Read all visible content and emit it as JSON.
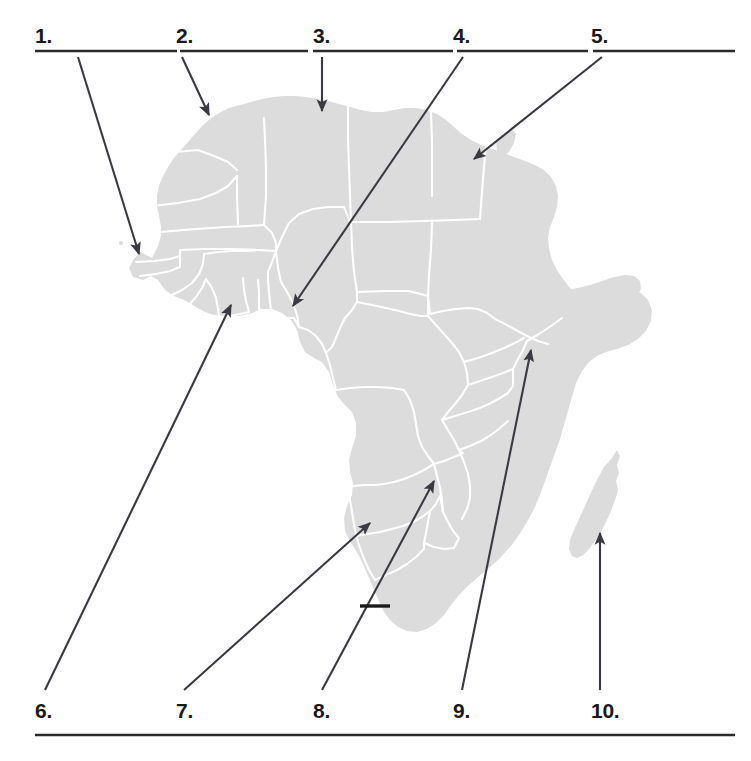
{
  "worksheet": {
    "title": "Africa map labeling worksheet",
    "map_name": "africa-map",
    "map_fill": "#dcdcdc",
    "map_border": "#ffffff",
    "arrow_color": "#3a3a42",
    "rule_color": "#2b2b2b",
    "background": "#ffffff"
  },
  "top_blanks": [
    {
      "number": "1.",
      "label_x": 35,
      "label_y": 25,
      "line_x": 35,
      "line_y": 51,
      "line_w": 142
    },
    {
      "number": "2.",
      "label_x": 176,
      "label_y": 25,
      "line_x": 180,
      "line_y": 51,
      "line_w": 128
    },
    {
      "number": "3.",
      "label_x": 313,
      "label_y": 25,
      "line_x": 313,
      "line_y": 51,
      "line_w": 140
    },
    {
      "number": "4.",
      "label_x": 453,
      "label_y": 25,
      "line_x": 457,
      "line_y": 51,
      "line_w": 131
    },
    {
      "number": "5.",
      "label_x": 591,
      "label_y": 25,
      "line_x": 593,
      "line_y": 51,
      "line_w": 142
    }
  ],
  "bottom_blanks": [
    {
      "number": "6.",
      "label_x": 35,
      "label_y": 700
    },
    {
      "number": "7.",
      "label_x": 176,
      "label_y": 700
    },
    {
      "number": "8.",
      "label_x": 313,
      "label_y": 700
    },
    {
      "number": "9.",
      "label_x": 453,
      "label_y": 700
    },
    {
      "number": "10.",
      "label_x": 591,
      "label_y": 700
    }
  ],
  "bottom_rule": {
    "x": 35,
    "y": 735,
    "w": 700
  },
  "pointers": [
    {
      "id": "pointer-1",
      "from": [
        78,
        57
      ],
      "to": [
        139,
        254
      ],
      "target_hint": "west-africa-coast"
    },
    {
      "id": "pointer-2",
      "from": [
        182,
        57
      ],
      "to": [
        209,
        115
      ],
      "target_hint": "northwest-africa"
    },
    {
      "id": "pointer-3",
      "from": [
        322,
        57
      ],
      "to": [
        322,
        111
      ],
      "target_hint": "north-africa-coast"
    },
    {
      "id": "pointer-4",
      "from": [
        463,
        57
      ],
      "to": [
        293,
        306
      ],
      "target_hint": "west-central-africa"
    },
    {
      "id": "pointer-5",
      "from": [
        602,
        57
      ],
      "to": [
        474,
        159
      ],
      "target_hint": "northeast-africa"
    },
    {
      "id": "pointer-6",
      "from": [
        45,
        690
      ],
      "to": [
        231,
        305
      ],
      "target_hint": "gulf-of-guinea-coast"
    },
    {
      "id": "pointer-7",
      "from": [
        184,
        690
      ],
      "to": [
        370,
        523
      ],
      "target_hint": "southwest-africa"
    },
    {
      "id": "pointer-8",
      "from": [
        322,
        690
      ],
      "to": [
        434,
        481
      ],
      "target_hint": "south-central-africa"
    },
    {
      "id": "pointer-9",
      "from": [
        462,
        690
      ],
      "to": [
        531,
        350
      ],
      "target_hint": "east-africa"
    },
    {
      "id": "pointer-10",
      "from": [
        600,
        690
      ],
      "to": [
        600,
        533
      ],
      "target_hint": "island-southeast"
    }
  ],
  "leader_tick": {
    "id": "leader-tick-lesotho",
    "from": [
      360,
      606
    ],
    "to": [
      390,
      606
    ]
  }
}
